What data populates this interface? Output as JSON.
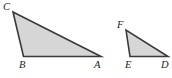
{
  "figure": {
    "kind": "similar-triangles-diagram",
    "background_color": "#ffffff",
    "fill_color": "#d6d6d6",
    "stroke_color": "#3a3a3a",
    "label_color": "#1c1c1c",
    "stroke_width": 1.6,
    "canvas": {
      "width": 172,
      "height": 78
    },
    "shapes": [
      {
        "name": "triangle-abc",
        "vertices": [
          {
            "label": "C",
            "x": 13,
            "y": 12
          },
          {
            "label": "B",
            "x": 23.5,
            "y": 56.5
          },
          {
            "label": "A",
            "x": 101,
            "y": 56.5
          }
        ],
        "points": "13,12 23.5,56.5 101,56.5"
      },
      {
        "name": "triangle-def",
        "vertices": [
          {
            "label": "F",
            "x": 126,
            "y": 30
          },
          {
            "label": "E",
            "x": 130,
            "y": 56.5
          },
          {
            "label": "D",
            "x": 168,
            "y": 56.5
          }
        ],
        "points": "126,30 130,56.5 168,56.5"
      }
    ],
    "labels": [
      {
        "name": "label-c",
        "text": "C",
        "x": 3,
        "y": 1
      },
      {
        "name": "label-b",
        "text": "B",
        "x": 19,
        "y": 59
      },
      {
        "name": "label-a",
        "text": "A",
        "x": 94,
        "y": 59
      },
      {
        "name": "label-f",
        "text": "F",
        "x": 117,
        "y": 19
      },
      {
        "name": "label-e",
        "text": "E",
        "x": 125,
        "y": 59
      },
      {
        "name": "label-d",
        "text": "D",
        "x": 161,
        "y": 59
      }
    ]
  }
}
